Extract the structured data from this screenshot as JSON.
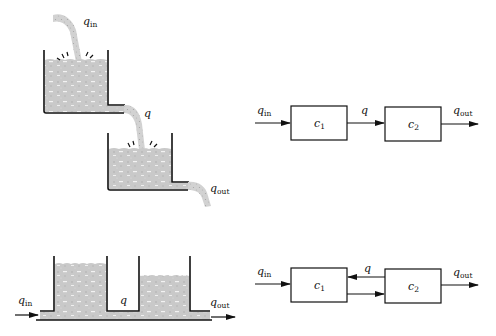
{
  "figure": {
    "top_row": {
      "physical": {
        "description": "two cascaded tanks, upper tank drains into lower tank",
        "labels": {
          "inflow": "q",
          "inflow_sub": "in",
          "middle": "q",
          "outflow": "q",
          "outflow_sub": "out"
        }
      },
      "block_diagram": {
        "blocks": [
          {
            "label": "c",
            "sub": "1"
          },
          {
            "label": "c",
            "sub": "2"
          }
        ],
        "labels": {
          "inflow": "q",
          "inflow_sub": "in",
          "middle": "q",
          "outflow": "q",
          "outflow_sub": "out"
        },
        "connections": [
          "in -> c1",
          "c1 -> c2",
          "c2 -> out"
        ]
      }
    },
    "bottom_row": {
      "physical": {
        "description": "two tanks connected at the bottom by a shared pipe",
        "labels": {
          "inflow": "q",
          "inflow_sub": "in",
          "middle": "q",
          "outflow": "q",
          "outflow_sub": "out"
        }
      },
      "block_diagram": {
        "blocks": [
          {
            "label": "c",
            "sub": "1"
          },
          {
            "label": "c",
            "sub": "2"
          }
        ],
        "labels": {
          "inflow": "q",
          "inflow_sub": "in",
          "middle": "q",
          "outflow": "q",
          "outflow_sub": "out"
        },
        "connections": [
          "in -> c1",
          "c1 -> c2",
          "c2 -> c1",
          "c2 -> out"
        ]
      }
    },
    "colors": {
      "ink": "#111111",
      "water": "#c8c8c8",
      "background": "#ffffff"
    }
  }
}
